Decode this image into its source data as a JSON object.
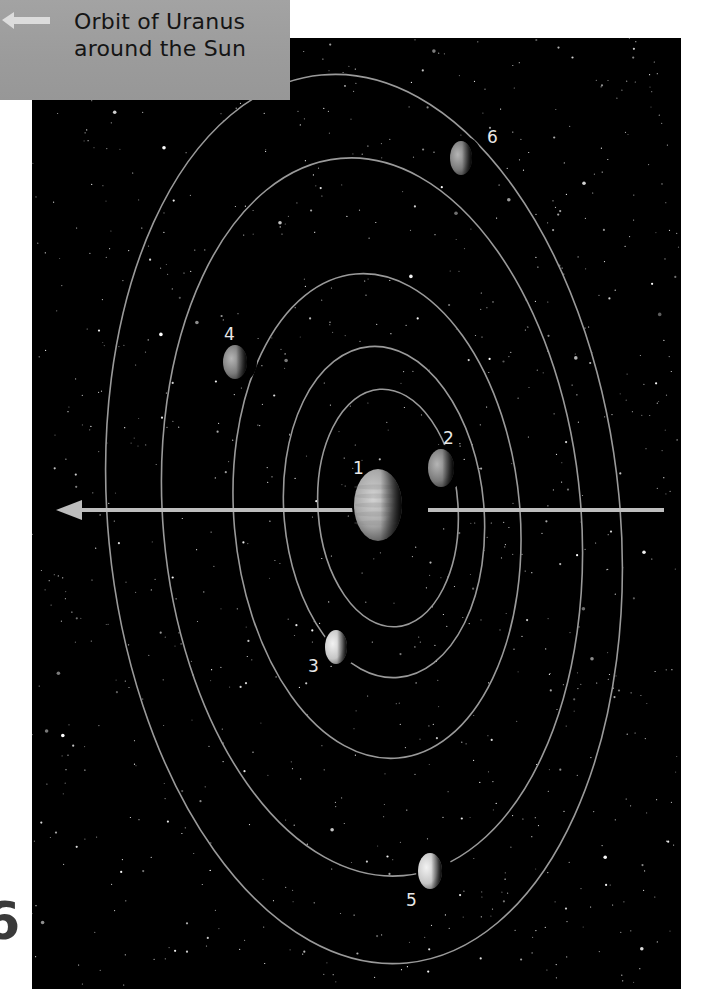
{
  "caption": {
    "line1": "Orbit of Uranus",
    "line2": "around the Sun",
    "arrow": "left-arrow-icon"
  },
  "page_fragment": "6",
  "colors": {
    "space": "#000000",
    "orbit": "#9a9a9a",
    "caption_bg": "#9e9e9e",
    "caption_text": "#151515",
    "axis_arrow": "#bdbdbd"
  },
  "bodies": [
    {
      "id": 1,
      "label": "1",
      "name": "uranus",
      "cx": 378,
      "cy": 505,
      "rx": 24,
      "ry": 36,
      "label_x": 353,
      "label_y": 474,
      "shade": "#b0b0b0"
    },
    {
      "id": 2,
      "label": "2",
      "name": "moon-2",
      "cx": 441,
      "cy": 468,
      "rx": 13,
      "ry": 19,
      "label_x": 443,
      "label_y": 444,
      "shade": "#7d7d7d"
    },
    {
      "id": 3,
      "label": "3",
      "name": "moon-3",
      "cx": 336,
      "cy": 647,
      "rx": 11,
      "ry": 17,
      "label_x": 308,
      "label_y": 672,
      "shade": "#cfcfcf"
    },
    {
      "id": 4,
      "label": "4",
      "name": "moon-4",
      "cx": 235,
      "cy": 362,
      "rx": 12,
      "ry": 17,
      "label_x": 224,
      "label_y": 340,
      "shade": "#8a8a8a"
    },
    {
      "id": 5,
      "label": "5",
      "name": "moon-5",
      "cx": 430,
      "cy": 871,
      "rx": 12,
      "ry": 18,
      "label_x": 406,
      "label_y": 906,
      "shade": "#d0d0d0"
    },
    {
      "id": 6,
      "label": "6",
      "name": "moon-6",
      "cx": 461,
      "cy": 158,
      "rx": 11,
      "ry": 17,
      "label_x": 487,
      "label_y": 143,
      "shade": "#9a9a9a"
    }
  ],
  "orbits": [
    {
      "moon": 2,
      "cx": 388,
      "cy": 508,
      "rx": 70,
      "ry": 119,
      "tilt": -4
    },
    {
      "moon": 3,
      "cx": 384,
      "cy": 512,
      "rx": 100,
      "ry": 166,
      "tilt": -5
    },
    {
      "moon": 4,
      "cx": 377,
      "cy": 516,
      "rx": 143,
      "ry": 243,
      "tilt": -5
    },
    {
      "moon": 5,
      "cx": 372,
      "cy": 517,
      "rx": 209,
      "ry": 360,
      "tilt": -5
    },
    {
      "moon": 6,
      "cx": 364,
      "cy": 519,
      "rx": 256,
      "ry": 446,
      "tilt": -5.5
    }
  ],
  "axis_arrow": {
    "x1": 56,
    "x2": 664,
    "y": 510,
    "gap_from": 400,
    "gap_to": 428
  },
  "stars": {
    "count": 900,
    "seed": 7
  }
}
